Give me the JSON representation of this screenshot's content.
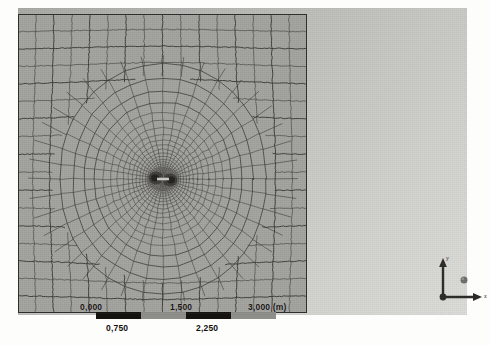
{
  "figure": {
    "kind": "fem-mesh-viewport",
    "background_gradient_from": "#a9a9a6",
    "background_gradient_to": "#dcdcd9",
    "mesh_fill": "#a2a29e",
    "mesh_line": "#3b3a36"
  },
  "scale_bar": {
    "unit_label": "(m)",
    "major_ticks": [
      "0,000",
      "1,500",
      "3,000 (m)"
    ],
    "minor_ticks": [
      "0,750",
      "2,250"
    ],
    "segments": [
      {
        "fill": "dark",
        "label": "0,750"
      },
      {
        "fill": "light",
        "label": "1,500"
      },
      {
        "fill": "dark",
        "label": "2,250"
      },
      {
        "fill": "light",
        "label": "3,000"
      }
    ]
  },
  "axis_triad": {
    "x_label": "x",
    "y_label": "y",
    "z_label": "z",
    "origin_marker": "origin-dot",
    "z_marker": "z-sphere"
  },
  "chart_data": {
    "type": "heatmap",
    "title": "",
    "xlabel": "",
    "ylabel": "",
    "grid": true,
    "legend": "none",
    "x": [
      0.0,
      0.75,
      1.5,
      2.25,
      3.0
    ],
    "tick_labels_major": [
      "0,000",
      "1,500",
      "3,000 (m)"
    ],
    "tick_labels_minor": [
      "0,750",
      "2,250"
    ],
    "xlim": [
      0.0,
      3.0
    ],
    "note": "Structured quadrilateral FE mesh, 3 m x 3 m domain, radially graded toward a central crack at the domain centre"
  }
}
